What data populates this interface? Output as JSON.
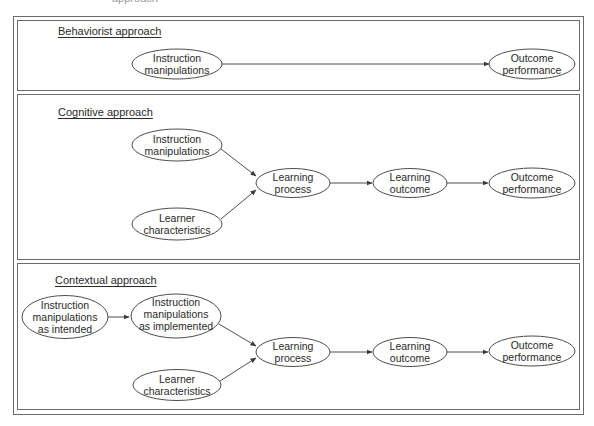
{
  "diagram": {
    "top_fragment": "approach",
    "colors": {
      "stroke": "#3a3a3a",
      "frame": "#6a6a6a",
      "text": "#2a2a2a",
      "background": "#ffffff"
    },
    "sections": [
      {
        "id": "behaviorist",
        "title": "Behaviorist approach",
        "nodes": [
          {
            "id": "b_im",
            "lines": [
              "Instruction",
              "manipulations"
            ]
          },
          {
            "id": "b_op",
            "lines": [
              "Outcome",
              "performance"
            ]
          }
        ],
        "edges": [
          [
            "b_im",
            "b_op"
          ]
        ]
      },
      {
        "id": "cognitive",
        "title": "Cognitive approach",
        "nodes": [
          {
            "id": "c_im",
            "lines": [
              "Instruction",
              "manipulations"
            ]
          },
          {
            "id": "c_lc",
            "lines": [
              "Learner",
              "characteristics"
            ]
          },
          {
            "id": "c_lp",
            "lines": [
              "Learning",
              "process"
            ]
          },
          {
            "id": "c_lo",
            "lines": [
              "Learning",
              "outcome"
            ]
          },
          {
            "id": "c_op",
            "lines": [
              "Outcome",
              "performance"
            ]
          }
        ],
        "edges": [
          [
            "c_im",
            "c_lp"
          ],
          [
            "c_lc",
            "c_lp"
          ],
          [
            "c_lp",
            "c_lo"
          ],
          [
            "c_lo",
            "c_op"
          ]
        ]
      },
      {
        "id": "contextual",
        "title": "Contextual approach",
        "nodes": [
          {
            "id": "x_ii",
            "lines": [
              "Instruction",
              "manipulations",
              "as intended"
            ]
          },
          {
            "id": "x_ip",
            "lines": [
              "Instruction",
              "manipulations",
              "as implemented"
            ]
          },
          {
            "id": "x_lc",
            "lines": [
              "Learner",
              "characteristics"
            ]
          },
          {
            "id": "x_lp",
            "lines": [
              "Learning",
              "process"
            ]
          },
          {
            "id": "x_lo",
            "lines": [
              "Learning",
              "outcome"
            ]
          },
          {
            "id": "x_op",
            "lines": [
              "Outcome",
              "performance"
            ]
          }
        ],
        "edges": [
          [
            "x_ii",
            "x_ip"
          ],
          [
            "x_ip",
            "x_lp"
          ],
          [
            "x_lc",
            "x_lp"
          ],
          [
            "x_lp",
            "x_lo"
          ],
          [
            "x_lo",
            "x_op"
          ]
        ]
      }
    ]
  }
}
